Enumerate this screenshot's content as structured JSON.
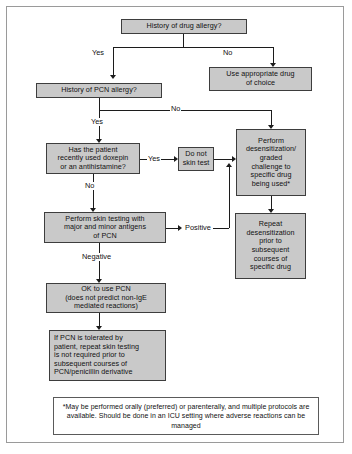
{
  "diagram": {
    "box_fill": "#c9c9c9",
    "box_stroke": "#3d3d3d",
    "line_color": "#1c1c1c",
    "background": "#ffffff"
  },
  "nodes": {
    "history_drug_allergy": "History of drug allergy?",
    "use_appropriate_drug": "Use appropriate drug\nof choice",
    "history_pcn_allergy": "History of PCN allergy?",
    "doxepin_antihistamine": "Has the patient\nrecently used doxepin\nor an antihistamine?",
    "do_not_skin_test": "Do not\nskin test",
    "perform_desensitization": "Perform\ndesensitization/\ngraded\nchallenge to\nspecific drug\nbeing used*",
    "perform_skin_testing": "Perform skin testing with\nmajor and minor antigens\nof PCN",
    "repeat_desensitization": "Repeat\ndesensitization\nprior to\nsubsequent\ncourses of\nspecific drug",
    "ok_to_use_pcn": "OK to use PCN\n(does not predict non-IgE\nmediated reactions)",
    "pcn_tolerated": "If PCN is tolerated by\npatient, repeat skin testing\nis not required prior to\nsubsequent courses of\nPCN/penicillin derivative",
    "footnote": "*May be performed orally (preferred) or parenterally, and multiple protocols are available.  Should be done in an ICU setting where adverse reactions can be managed"
  },
  "edge_labels": {
    "yes_drug_allergy": "Yes",
    "no_drug_allergy": "No",
    "yes_pcn_allergy": "Yes",
    "no_pcn_allergy": "No",
    "yes_doxepin": "Yes",
    "no_doxepin": "No",
    "positive": "Positive",
    "negative": "Negative"
  }
}
